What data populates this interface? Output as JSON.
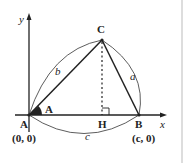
{
  "diagram": {
    "axes": {
      "x_label": "x",
      "y_label": "y"
    },
    "vertices": {
      "A": {
        "label": "A",
        "coord": "(0, 0)"
      },
      "B": {
        "label": "B",
        "coord": "(c, 0)"
      },
      "C": {
        "label": "C"
      },
      "H": {
        "label": "H"
      }
    },
    "angle_label": "A",
    "sides": {
      "a": "a",
      "b": "b",
      "c": "c"
    },
    "colors": {
      "stroke": "#222222",
      "angle_fill": "#222222",
      "border": "#bbbbbb"
    }
  }
}
